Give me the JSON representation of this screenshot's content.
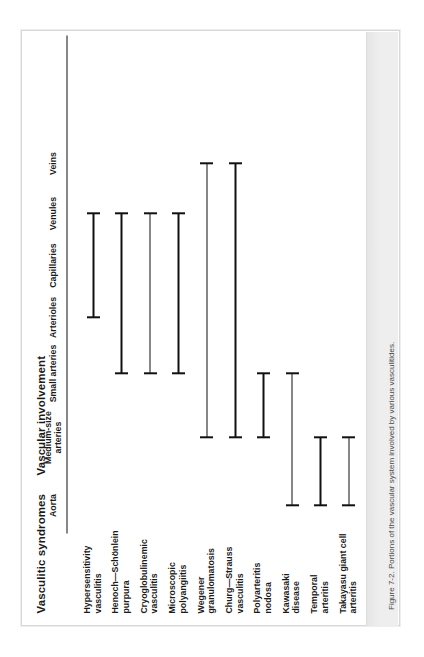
{
  "figure": {
    "row_group_title": "Vasculitic syndromes",
    "column_group_title": "Vascular involvement",
    "caption": "Figure 7-2. Portions of the vascular system involved by various vasculitides.",
    "line_color": "#111111",
    "background": "#ffffff",
    "caption_strip_color": "#eeeeee"
  },
  "chart_data": {
    "type": "bar",
    "title": "Vascular involvement",
    "subtitle": "Vasculitic syndromes",
    "xlabel": "Vascular involvement",
    "ylabel": "Vasculitic syndromes",
    "orientation": "horizontal-range",
    "grid": false,
    "legend": "none",
    "columns": [
      "Aorta",
      "Medium-size arteries",
      "Small arteries",
      "Arterioles",
      "Capillaries",
      "Venules",
      "Veins"
    ],
    "column_labels_display": [
      "Aorta",
      "Medium-size\narteries",
      "Small arteries",
      "Arterioles",
      "Capillaries",
      "Venules",
      "Veins"
    ],
    "categories": [
      "Hypersensitivity vasculitis",
      "Henoch–Schönlein purpura",
      "Cryoglobulinemic vasculitis",
      "Microscopic polyangiitis",
      "Wegener granulomatosis",
      "Churg–Strauss vasculitis",
      "Polyarteritis nodosa",
      "Kawasaki disease",
      "Temporal arteritis",
      "Takayasu giant cell arteritis"
    ],
    "category_labels_display": [
      "Hypersensitivity\nvasculitis",
      "Henoch—Schönlein\npurpura",
      "Cryoglobulinemic\nvasculitis",
      "Microscopic\npolyangiitis",
      "Wegener\ngranulomatosis",
      "Churg—Strauss\nvasculitis",
      "Polyarteritis\nnodosa",
      "Kawasaki\ndisease",
      "Temporal\narteritis",
      "Takayasu giant cell\narteritis"
    ],
    "ranges": [
      {
        "syndrome": "Hypersensitivity vasculitis",
        "from": "Arterioles",
        "to": "Venules"
      },
      {
        "syndrome": "Henoch–Schönlein purpura",
        "from": "Small arteries",
        "to": "Venules"
      },
      {
        "syndrome": "Cryoglobulinemic vasculitis",
        "from": "Small arteries",
        "to": "Venules"
      },
      {
        "syndrome": "Microscopic polyangiitis",
        "from": "Small arteries",
        "to": "Venules"
      },
      {
        "syndrome": "Wegener granulomatosis",
        "from": "Medium-size arteries",
        "to": "Veins"
      },
      {
        "syndrome": "Churg–Strauss vasculitis",
        "from": "Medium-size arteries",
        "to": "Veins"
      },
      {
        "syndrome": "Polyarteritis nodosa",
        "from": "Medium-size arteries",
        "to": "Small arteries"
      },
      {
        "syndrome": "Kawasaki disease",
        "from": "Aorta",
        "to": "Small arteries"
      },
      {
        "syndrome": "Temporal arteritis",
        "from": "Aorta",
        "to": "Medium-size arteries"
      },
      {
        "syndrome": "Takayasu giant cell arteritis",
        "from": "Aorta",
        "to": "Medium-size arteries"
      }
    ]
  }
}
